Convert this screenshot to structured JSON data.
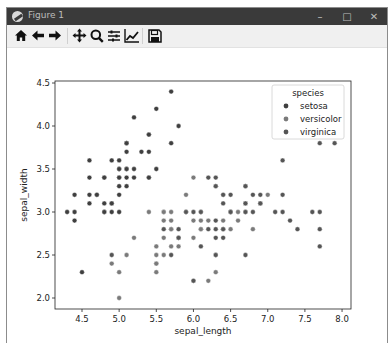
{
  "window": {
    "title": "Figure 1",
    "controls": {
      "minimize": "–",
      "maximize": "□",
      "close": "✕"
    }
  },
  "toolbar": {
    "buttons": [
      {
        "name": "home-button",
        "icon": "home-icon"
      },
      {
        "name": "back-button",
        "icon": "arrow-left-icon"
      },
      {
        "name": "forward-button",
        "icon": "arrow-right-icon"
      },
      {
        "name": "pan-button",
        "icon": "move-icon"
      },
      {
        "name": "zoom-button",
        "icon": "magnifier-icon"
      },
      {
        "name": "subplots-button",
        "icon": "sliders-icon"
      },
      {
        "name": "edit-axes-button",
        "icon": "line-chart-icon"
      },
      {
        "name": "save-button",
        "icon": "floppy-disk-icon"
      }
    ]
  },
  "colors": {
    "setosa": "#3f3f3f",
    "versicolor": "#7a7a7a",
    "virginica": "#555555",
    "axis": "#222222",
    "titlebar": "#3a3a3a",
    "toolbar": "#f0f0f0"
  },
  "chart_data": {
    "type": "scatter",
    "title": "",
    "xlabel": "sepal_length",
    "ylabel": "sepal_width",
    "xlim": [
      4.2,
      8.1
    ],
    "ylim": [
      1.9,
      4.5
    ],
    "xticks": [
      "4.5",
      "5.0",
      "5.5",
      "6.0",
      "6.5",
      "7.0",
      "7.5",
      "8.0"
    ],
    "yticks": [
      "2.0",
      "2.5",
      "3.0",
      "3.5",
      "4.0",
      "4.5"
    ],
    "grid": false,
    "legend": {
      "title": "species",
      "position": "upper right",
      "entries": [
        "setosa",
        "versicolor",
        "virginica"
      ]
    },
    "series": [
      {
        "name": "setosa",
        "points": [
          [
            5.1,
            3.5
          ],
          [
            4.9,
            3.0
          ],
          [
            4.7,
            3.2
          ],
          [
            4.6,
            3.1
          ],
          [
            5.0,
            3.6
          ],
          [
            5.4,
            3.9
          ],
          [
            4.6,
            3.4
          ],
          [
            5.0,
            3.4
          ],
          [
            4.4,
            2.9
          ],
          [
            4.9,
            3.1
          ],
          [
            5.4,
            3.7
          ],
          [
            4.8,
            3.4
          ],
          [
            4.8,
            3.0
          ],
          [
            4.3,
            3.0
          ],
          [
            5.8,
            4.0
          ],
          [
            5.7,
            4.4
          ],
          [
            5.4,
            3.9
          ],
          [
            5.1,
            3.5
          ],
          [
            5.7,
            3.8
          ],
          [
            5.1,
            3.8
          ],
          [
            5.4,
            3.4
          ],
          [
            5.1,
            3.7
          ],
          [
            4.6,
            3.6
          ],
          [
            5.1,
            3.3
          ],
          [
            4.8,
            3.4
          ],
          [
            5.0,
            3.0
          ],
          [
            5.0,
            3.4
          ],
          [
            5.2,
            3.5
          ],
          [
            5.2,
            3.4
          ],
          [
            4.7,
            3.2
          ],
          [
            4.8,
            3.1
          ],
          [
            5.4,
            3.4
          ],
          [
            5.2,
            4.1
          ],
          [
            5.5,
            4.2
          ],
          [
            4.9,
            3.1
          ],
          [
            5.0,
            3.2
          ],
          [
            5.5,
            3.5
          ],
          [
            4.9,
            3.6
          ],
          [
            4.4,
            3.0
          ],
          [
            5.1,
            3.4
          ],
          [
            5.0,
            3.5
          ],
          [
            4.5,
            2.3
          ],
          [
            4.4,
            3.2
          ],
          [
            5.0,
            3.5
          ],
          [
            5.1,
            3.8
          ],
          [
            4.8,
            3.0
          ],
          [
            5.1,
            3.8
          ],
          [
            4.6,
            3.2
          ],
          [
            5.3,
            3.7
          ],
          [
            5.0,
            3.3
          ]
        ]
      },
      {
        "name": "versicolor",
        "points": [
          [
            7.0,
            3.2
          ],
          [
            6.4,
            3.2
          ],
          [
            6.9,
            3.1
          ],
          [
            5.5,
            2.3
          ],
          [
            6.5,
            2.8
          ],
          [
            5.7,
            2.8
          ],
          [
            6.3,
            3.3
          ],
          [
            4.9,
            2.4
          ],
          [
            6.6,
            2.9
          ],
          [
            5.2,
            2.7
          ],
          [
            5.0,
            2.0
          ],
          [
            5.9,
            3.0
          ],
          [
            6.0,
            2.2
          ],
          [
            6.1,
            2.9
          ],
          [
            5.6,
            2.9
          ],
          [
            6.7,
            3.1
          ],
          [
            5.6,
            3.0
          ],
          [
            5.8,
            2.7
          ],
          [
            6.2,
            2.2
          ],
          [
            5.6,
            2.5
          ],
          [
            5.9,
            3.2
          ],
          [
            6.1,
            2.8
          ],
          [
            6.3,
            2.5
          ],
          [
            6.1,
            2.8
          ],
          [
            6.4,
            2.9
          ],
          [
            6.6,
            3.0
          ],
          [
            6.8,
            2.8
          ],
          [
            6.7,
            3.0
          ],
          [
            6.0,
            2.9
          ],
          [
            5.7,
            2.6
          ],
          [
            5.5,
            2.4
          ],
          [
            5.5,
            2.4
          ],
          [
            5.8,
            2.7
          ],
          [
            6.0,
            2.7
          ],
          [
            5.4,
            3.0
          ],
          [
            6.0,
            3.4
          ],
          [
            6.7,
            3.1
          ],
          [
            6.3,
            2.3
          ],
          [
            5.6,
            3.0
          ],
          [
            5.5,
            2.5
          ],
          [
            5.5,
            2.6
          ],
          [
            6.1,
            3.0
          ],
          [
            5.8,
            2.6
          ],
          [
            5.0,
            2.3
          ],
          [
            5.6,
            2.7
          ],
          [
            5.7,
            3.0
          ],
          [
            5.7,
            2.9
          ],
          [
            6.2,
            2.9
          ],
          [
            5.1,
            2.5
          ],
          [
            5.7,
            2.8
          ]
        ]
      },
      {
        "name": "virginica",
        "points": [
          [
            6.3,
            3.3
          ],
          [
            5.8,
            2.7
          ],
          [
            7.1,
            3.0
          ],
          [
            6.3,
            2.9
          ],
          [
            6.5,
            3.0
          ],
          [
            7.6,
            3.0
          ],
          [
            4.9,
            2.5
          ],
          [
            7.3,
            2.9
          ],
          [
            6.7,
            2.5
          ],
          [
            7.2,
            3.6
          ],
          [
            6.5,
            3.2
          ],
          [
            6.4,
            2.7
          ],
          [
            6.8,
            3.0
          ],
          [
            5.7,
            2.5
          ],
          [
            5.8,
            2.8
          ],
          [
            6.4,
            3.2
          ],
          [
            6.5,
            3.0
          ],
          [
            7.7,
            3.8
          ],
          [
            7.7,
            2.6
          ],
          [
            6.0,
            2.2
          ],
          [
            6.9,
            3.2
          ],
          [
            5.6,
            2.8
          ],
          [
            7.7,
            2.8
          ],
          [
            6.3,
            2.7
          ],
          [
            6.7,
            3.3
          ],
          [
            7.2,
            3.2
          ],
          [
            6.2,
            2.8
          ],
          [
            6.1,
            3.0
          ],
          [
            6.4,
            2.8
          ],
          [
            7.2,
            3.0
          ],
          [
            7.4,
            2.8
          ],
          [
            7.9,
            3.8
          ],
          [
            6.4,
            2.8
          ],
          [
            6.3,
            2.8
          ],
          [
            6.1,
            2.6
          ],
          [
            7.7,
            3.0
          ],
          [
            6.3,
            3.4
          ],
          [
            6.4,
            3.1
          ],
          [
            6.0,
            3.0
          ],
          [
            6.9,
            3.1
          ],
          [
            6.7,
            3.1
          ],
          [
            6.9,
            3.1
          ],
          [
            5.8,
            2.7
          ],
          [
            6.8,
            3.2
          ],
          [
            6.7,
            3.3
          ],
          [
            6.7,
            3.0
          ],
          [
            6.3,
            2.5
          ],
          [
            6.5,
            3.0
          ],
          [
            6.2,
            3.4
          ],
          [
            5.9,
            3.0
          ]
        ]
      }
    ]
  }
}
